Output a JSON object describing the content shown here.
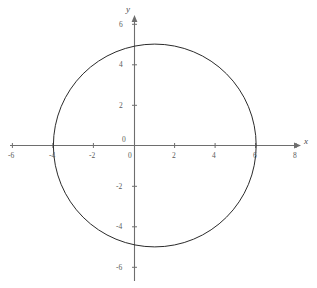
{
  "chart_data": {
    "type": "scatter",
    "title": "",
    "xlabel": "x",
    "ylabel": "y",
    "xlim": [
      -6.6,
      8.0
    ],
    "ylim": [
      -6.8,
      6.3
    ],
    "grid": false,
    "legend": null,
    "shape": {
      "name": "circle",
      "center_x": 1,
      "center_y": 0,
      "radius": 5,
      "equation": "(x - 1)^2 + y^2 = 25",
      "x_intercepts": [
        -4,
        6
      ],
      "y_intercepts": [
        -4.9,
        4.9
      ],
      "stroke": "#2b2b2b",
      "stroke_width": 1
    },
    "x_ticks": [
      {
        "value": -6,
        "label": "-6"
      },
      {
        "value": -4,
        "label": "-4"
      },
      {
        "value": -2,
        "label": "-2"
      },
      {
        "value": 0,
        "label": "0"
      },
      {
        "value": 2,
        "label": "2"
      },
      {
        "value": 4,
        "label": "4"
      },
      {
        "value": 6,
        "label": "6"
      },
      {
        "value": 8,
        "label": "8"
      }
    ],
    "y_ticks": [
      {
        "value": 6,
        "label": "6"
      },
      {
        "value": 4,
        "label": "4"
      },
      {
        "value": 2,
        "label": "2"
      },
      {
        "value": 0,
        "label": "0"
      },
      {
        "value": -2,
        "label": "-2"
      },
      {
        "value": -4,
        "label": "-4"
      },
      {
        "value": -6,
        "label": "-6"
      }
    ]
  },
  "axes": {
    "x_axis_name": "x",
    "y_axis_name": "y",
    "origin_label": "0",
    "axis_color": "#6e6e6e"
  },
  "labels": {
    "x_neg6": "-6",
    "x_neg4": "-4",
    "x_neg2": "-2",
    "x_zero": "0",
    "x_pos2": "2",
    "x_pos4": "4",
    "x_pos6": "6",
    "x_pos8": "8",
    "y_pos6": "6",
    "y_pos4": "4",
    "y_pos2": "2",
    "y_zero": "0",
    "y_neg2": "-2",
    "y_neg4": "-4",
    "y_neg6": "-6"
  },
  "caption": {
    "top_text": ""
  },
  "colors": {
    "background": "#ffffff",
    "curve": "#2b2b2b",
    "axis": "#6e6e6e",
    "tick_text": "#5b5b5b"
  }
}
